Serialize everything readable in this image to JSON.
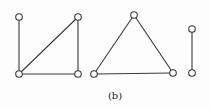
{
  "figure": {
    "caption": "(b)",
    "colors": {
      "stroke": "#3a3a3a",
      "node_fill": "#ffffff"
    },
    "graphs": [
      {
        "name": "graph-left",
        "nodes": [
          [
            19,
            17
          ],
          [
            78,
            17
          ],
          [
            19,
            74
          ],
          [
            78,
            74
          ]
        ],
        "edges": [
          [
            0,
            2
          ],
          [
            2,
            3
          ],
          [
            3,
            1
          ],
          [
            2,
            1
          ]
        ]
      },
      {
        "name": "graph-triangle",
        "nodes": [
          [
            94,
            74
          ],
          [
            134,
            15
          ],
          [
            173,
            73
          ]
        ],
        "edges": [
          [
            0,
            1
          ],
          [
            1,
            2
          ],
          [
            0,
            2
          ]
        ]
      },
      {
        "name": "graph-edge",
        "nodes": [
          [
            192,
            29
          ],
          [
            192,
            73
          ]
        ],
        "edges": [
          [
            0,
            1
          ]
        ]
      }
    ]
  }
}
